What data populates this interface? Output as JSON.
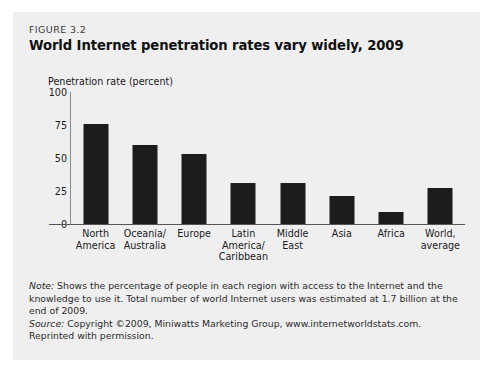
{
  "figure": {
    "number": "FIGURE 3.2",
    "title": "World Internet penetration rates vary widely, 2009"
  },
  "chart_data": {
    "type": "bar",
    "title": "World Internet penetration rates vary widely, 2009",
    "xlabel": "",
    "ylabel": "Penetration rate (percent)",
    "categories": [
      "North America",
      "Oceania/ Australia",
      "Europe",
      "Latin America/ Caribbean",
      "Middle East",
      "Asia",
      "Africa",
      "World, average"
    ],
    "category_lines": [
      [
        "North",
        "America"
      ],
      [
        "Oceania/",
        "Australia"
      ],
      [
        "Europe"
      ],
      [
        "Latin",
        "America/",
        "Caribbean"
      ],
      [
        "Middle",
        "East"
      ],
      [
        "Asia"
      ],
      [
        "Africa"
      ],
      [
        "World,",
        "average"
      ]
    ],
    "values": [
      76,
      60,
      53,
      31,
      31,
      21,
      9,
      27
    ],
    "ylim": [
      0,
      100
    ],
    "yticks": [
      0,
      25,
      50,
      75,
      100
    ],
    "ytick_labels": [
      "0",
      "25",
      "50",
      "75",
      "100"
    ],
    "grid": false,
    "legend": false,
    "bar_color": "#1c1c1c"
  },
  "notes": {
    "note_label": "Note:",
    "note_text": " Shows the percentage of people in each region with access to the Internet and the knowledge to use it. Total number of world Internet users was estimated at 1.7 billion at the end of 2009.",
    "source_label": "Source:",
    "source_text": " Copyright ©2009, Miniwatts Marketing Group, www.internetworldstats.com. Reprinted with permission."
  }
}
